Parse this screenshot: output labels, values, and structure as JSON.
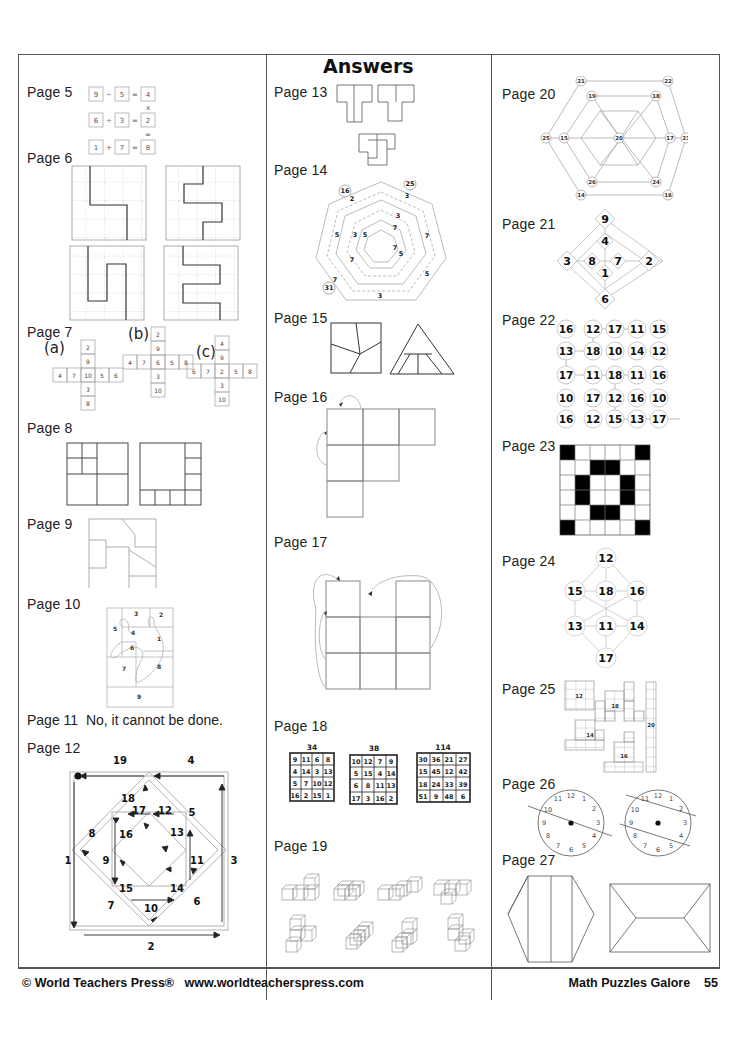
{
  "header": {
    "title": "Answers"
  },
  "footer": {
    "copyright": "© World Teachers Press®",
    "url": "www.worldteacherspress.com",
    "book_title": "Math Puzzles Galore",
    "page_number": "55"
  },
  "labels": {
    "p5": "Page 5",
    "p6": "Page 6",
    "p7": "Page 7",
    "p8": "Page 8",
    "p9": "Page 9",
    "p10": "Page 10",
    "p11": "Page 11",
    "p12": "Page 12",
    "p13": "Page 13",
    "p14": "Page 14",
    "p15": "Page 15",
    "p16": "Page 16",
    "p17": "Page 17",
    "p18": "Page 18",
    "p19": "Page 19",
    "p20": "Page 20",
    "p21": "Page 21",
    "p22": "Page 22",
    "p23": "Page 23",
    "p24": "Page 24",
    "p25": "Page 25",
    "p26": "Page 26",
    "p27": "Page 27"
  },
  "page5": {
    "rows": [
      [
        "9",
        "−",
        "5",
        "=",
        "4"
      ],
      [
        "6",
        "÷",
        "3",
        "=",
        "2"
      ],
      [
        "1",
        "+",
        "7",
        "=",
        "8"
      ]
    ],
    "vertical_ops": [
      "x",
      "="
    ]
  },
  "page7": {
    "a": {
      "label": "(a)",
      "col": [
        "2",
        "9",
        "10",
        "3",
        "8"
      ],
      "row": [
        "4",
        "7",
        "10",
        "5",
        "6"
      ]
    },
    "b": {
      "label": "(b)",
      "col": [
        "2",
        "9",
        "6",
        "3",
        "10"
      ],
      "row": [
        "4",
        "7",
        "6",
        "5",
        "8"
      ]
    },
    "c": {
      "label": "(c)",
      "col": [
        "4",
        "9",
        "2",
        "3",
        "10"
      ],
      "row": [
        "6",
        "7",
        "2",
        "5",
        "8"
      ]
    }
  },
  "page10": {
    "numbers": [
      "3",
      "2",
      "5",
      "4",
      "1",
      "6",
      "7",
      "8",
      "9"
    ]
  },
  "page11": {
    "answer": "No, it cannot be done."
  },
  "page12": {
    "numbers": [
      "19",
      "4",
      "18",
      "17",
      "12",
      "5",
      "8",
      "16",
      "13",
      "1",
      "9",
      "11",
      "3",
      "15",
      "14",
      "7",
      "10",
      "6",
      "2"
    ]
  },
  "page14": {
    "circled": [
      "16",
      "25",
      "31"
    ],
    "numbers": [
      "2",
      "3",
      "3",
      "5",
      "7",
      "3",
      "5",
      "7",
      "7",
      "7",
      "5",
      "7",
      "5",
      "3"
    ]
  },
  "page18": {
    "squares": [
      {
        "sum": "34",
        "cells": [
          [
            "9",
            "11",
            "6",
            "8"
          ],
          [
            "4",
            "14",
            "3",
            "13"
          ],
          [
            "5",
            "7",
            "10",
            "12"
          ],
          [
            "16",
            "2",
            "15",
            "1"
          ]
        ]
      },
      {
        "sum": "38",
        "cells": [
          [
            "10",
            "12",
            "7",
            "9"
          ],
          [
            "5",
            "15",
            "4",
            "14"
          ],
          [
            "6",
            "8",
            "11",
            "13"
          ],
          [
            "17",
            "3",
            "16",
            "2"
          ]
        ]
      },
      {
        "sum": "114",
        "cells": [
          [
            "30",
            "36",
            "21",
            "27"
          ],
          [
            "15",
            "45",
            "12",
            "42"
          ],
          [
            "18",
            "24",
            "33",
            "39"
          ],
          [
            "51",
            "9",
            "48",
            "6"
          ]
        ]
      }
    ]
  },
  "page20": {
    "outer": [
      "21",
      "22",
      "23",
      "16",
      "14",
      "25"
    ],
    "inner": [
      "19",
      "18",
      "17",
      "24",
      "26",
      "15"
    ],
    "center": "20"
  },
  "page21": {
    "top": "9",
    "left": "3",
    "right": "2",
    "bottom": "6",
    "inner_top": "4",
    "inner_left": "8",
    "inner_right": "7",
    "inner_bottom": "1"
  },
  "page22": {
    "grid": [
      [
        "16",
        "12",
        "17",
        "11",
        "15"
      ],
      [
        "13",
        "18",
        "10",
        "14",
        "12"
      ],
      [
        "17",
        "11",
        "18",
        "11",
        "16"
      ],
      [
        "10",
        "17",
        "12",
        "16",
        "10"
      ],
      [
        "16",
        "12",
        "15",
        "13",
        "17"
      ]
    ]
  },
  "page23": {
    "grid": [
      [
        1,
        0,
        0,
        0,
        0,
        1
      ],
      [
        0,
        0,
        1,
        1,
        0,
        0
      ],
      [
        0,
        1,
        0,
        0,
        1,
        0
      ],
      [
        0,
        1,
        0,
        0,
        1,
        0
      ],
      [
        0,
        0,
        1,
        1,
        0,
        0
      ],
      [
        1,
        0,
        0,
        0,
        0,
        1
      ]
    ]
  },
  "page24": {
    "top": "12",
    "ul": "15",
    "center_top": "18",
    "ur": "16",
    "ll": "13",
    "center_bottom": "11",
    "lr": "14",
    "bottom": "17"
  },
  "page25": {
    "shapes": [
      "12",
      "18",
      "20",
      "14",
      "16"
    ]
  },
  "page26": {
    "clock_numbers": [
      "12",
      "1",
      "2",
      "3",
      "4",
      "5",
      "6",
      "7",
      "8",
      "9",
      "10",
      "11"
    ]
  }
}
